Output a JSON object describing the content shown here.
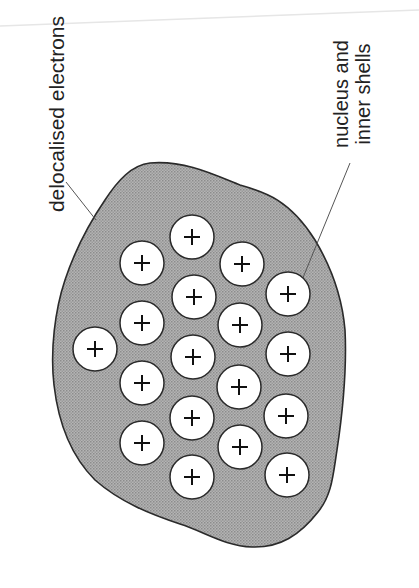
{
  "diagram": {
    "labels": {
      "electrons": "delocalised electrons",
      "nucleus_line1": "nucleus and",
      "nucleus_line2": "inner shells"
    },
    "ion_symbol": "+",
    "ion_count": 19,
    "colors": {
      "sea_fill": "#a6a6a6",
      "outline": "#2a2a2a",
      "ion_fill": "#ffffff",
      "text": "#222222",
      "leader": "#555555"
    },
    "ions": [
      {
        "x": 95,
        "y": 349
      },
      {
        "x": 142,
        "y": 263
      },
      {
        "x": 142,
        "y": 323
      },
      {
        "x": 142,
        "y": 383
      },
      {
        "x": 142,
        "y": 443
      },
      {
        "x": 192,
        "y": 237
      },
      {
        "x": 194,
        "y": 297
      },
      {
        "x": 193,
        "y": 357
      },
      {
        "x": 192,
        "y": 418
      },
      {
        "x": 192,
        "y": 477
      },
      {
        "x": 242,
        "y": 264
      },
      {
        "x": 240,
        "y": 325
      },
      {
        "x": 239,
        "y": 387
      },
      {
        "x": 240,
        "y": 447
      },
      {
        "x": 288,
        "y": 294
      },
      {
        "x": 288,
        "y": 354
      },
      {
        "x": 286,
        "y": 416
      },
      {
        "x": 287,
        "y": 475
      }
    ]
  }
}
